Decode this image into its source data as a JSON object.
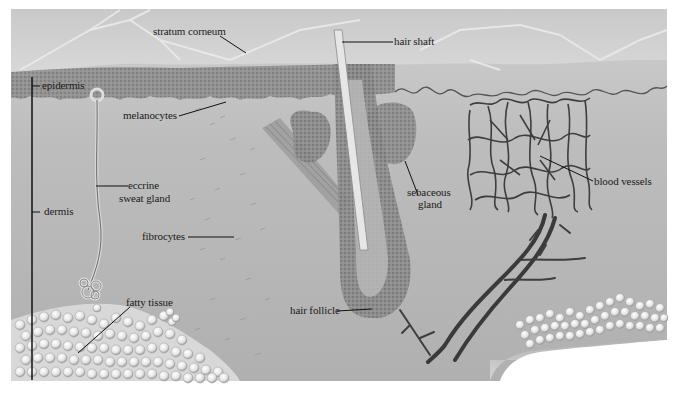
{
  "figure": {
    "labels": {
      "stratum_corneum": "stratum corneum",
      "hair_shaft": "hair shaft",
      "epidermis": "epidermis",
      "melanocytes": "melanocytes",
      "eccrine_sweat_gland_l1": "eccrine",
      "eccrine_sweat_gland_l2": "sweat gland",
      "dermis": "dermis",
      "fibrocytes": "fibrocytes",
      "sebaceous_gland_l1": "sebaceous",
      "sebaceous_gland_l2": "gland",
      "blood_vessels": "blood vessels",
      "hair_follicle": "hair follicle",
      "fatty_tissue": "fatty tissue"
    },
    "colors": {
      "background_gray": "#b4b4b4",
      "surface_light": "#d2d2d2",
      "epidermis_dark": "#6a6a6a",
      "vessel_dark": "#3c3c3c",
      "fat_light": "#e8e8e8",
      "leader_line": "#111111"
    }
  }
}
